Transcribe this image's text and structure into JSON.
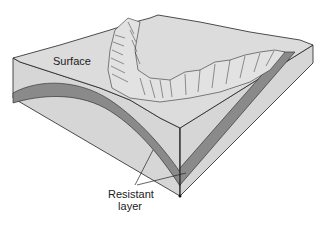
{
  "diagram": {
    "type": "geologic block diagram",
    "labels": {
      "surface": "Surface",
      "resistant_line1": "Resistant",
      "resistant_line2": "layer"
    },
    "colors": {
      "block_face": "#d6d6d6",
      "top_surface": "#dcdcdc",
      "resistant_layer": "#8a8a8a",
      "outline": "#222222",
      "background": "#ffffff"
    }
  }
}
